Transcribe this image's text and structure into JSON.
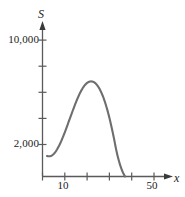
{
  "figure": {
    "background_color": "#ffffff",
    "curve_color": "#6e6e6e",
    "axis_color": "#5a5a5a",
    "text_color": "#1a1a1a"
  },
  "chart_data": {
    "type": "line",
    "title": "",
    "subtitle": "",
    "xlabel": "x",
    "ylabel": "S",
    "xlim": [
      0,
      56
    ],
    "ylim": [
      0,
      11500
    ],
    "grid": false,
    "legend": null,
    "x_ticks": [
      10,
      20,
      30,
      40,
      50
    ],
    "x_tick_labels": [
      "10",
      "",
      "",
      "",
      "50"
    ],
    "y_ticks": [
      2000,
      4000,
      6000,
      8000,
      10000
    ],
    "y_tick_labels": [
      "2,000",
      "",
      "",
      "",
      "10,000"
    ],
    "axis_arrows": {
      "x": "right",
      "y": "up"
    },
    "series": [
      {
        "name": "S",
        "x": [
          2,
          3,
          4,
          5,
          6,
          7,
          8,
          9,
          10,
          11,
          12,
          13,
          14,
          15,
          16,
          17,
          18,
          19,
          20,
          21,
          22,
          23,
          24,
          25,
          26,
          27,
          28,
          29,
          30,
          31,
          32,
          33,
          34,
          35,
          36,
          37
        ],
        "y": [
          1500,
          1480,
          1520,
          1650,
          1850,
          2120,
          2450,
          2830,
          3240,
          3680,
          4130,
          4580,
          5020,
          5440,
          5830,
          6180,
          6470,
          6700,
          6860,
          6950,
          6970,
          6920,
          6790,
          6580,
          6290,
          5920,
          5460,
          4920,
          4300,
          3600,
          2830,
          2000,
          1300,
          750,
          320,
          0
        ]
      }
    ],
    "annotations": []
  }
}
